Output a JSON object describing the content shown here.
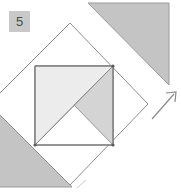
{
  "diagram": {
    "step_badge": {
      "label": "5",
      "background_color": "#c9c9c9",
      "text_color": "#4a4a4a"
    },
    "colors": {
      "paper_white": "#ffffff",
      "shade_dark": "#c4c4c4",
      "shade_medium": "#d4d4d4",
      "shade_light": "#ececec",
      "outline": "#8a8a8a",
      "outline_dark": "#6e6e6e",
      "crease": "#b5b5b5",
      "arrow": "#8a8a8a"
    },
    "shapes": [
      {
        "name": "top-right-triangle",
        "kind": "triangle",
        "fill": "#c4c4c4",
        "points": "88,3 169,3 169,85"
      },
      {
        "name": "bottom-left-triangle",
        "kind": "triangle",
        "fill": "#c4c4c4",
        "points": "-14,103 35,145 70,185 -14,185"
      },
      {
        "name": "main-diamond",
        "kind": "rotated-square",
        "fill": "#ffffff",
        "points": "70,23 148,104 70,185 -11,104"
      },
      {
        "name": "inner-square",
        "kind": "square",
        "fill": "#ffffff",
        "points": "35,66 113,66 113,145 35,145"
      },
      {
        "name": "upper-left-flap",
        "kind": "triangle",
        "fill": "#ececec",
        "points": "35,66 113,66 35,145"
      },
      {
        "name": "right-flap",
        "kind": "triangle",
        "fill": "#d4d4d4",
        "points": "113,66 113,145 74,105"
      }
    ],
    "arrow": {
      "name": "fold-direction-arrow",
      "direction": "northeast",
      "tail": {
        "x": 152,
        "y": 119
      },
      "head": {
        "x": 176,
        "y": 92
      }
    }
  }
}
